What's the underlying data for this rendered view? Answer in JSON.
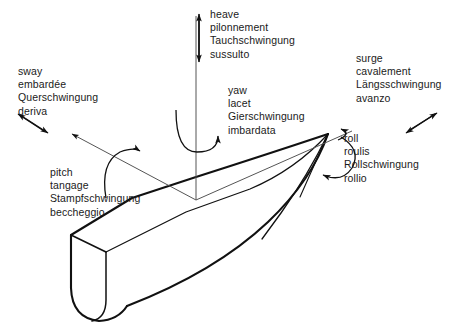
{
  "figure": {
    "stroke_color": "#111111",
    "text_color": "#1a1a1a",
    "background_color": "#ffffff"
  },
  "motions": {
    "heave": {
      "en": "heave",
      "fr": "pilonnement",
      "de": "Tauchschwingung",
      "it": "sussulto"
    },
    "sway": {
      "en": "sway",
      "fr": "embardée",
      "de": "Querschwingung",
      "it": "deriva"
    },
    "surge": {
      "en": "surge",
      "fr": "cavalement",
      "de": "Längsschwingung",
      "it": "avanzo"
    },
    "yaw": {
      "en": "yaw",
      "fr": "lacet",
      "de": "Gierschwingung",
      "it": "imbardata"
    },
    "roll": {
      "en": "roll",
      "fr": "roulis",
      "de": "Rollschwingung",
      "it": "rollio"
    },
    "pitch": {
      "en": "pitch",
      "fr": "tangage",
      "de": "Stampfschwingung",
      "it": "beccheggio"
    }
  }
}
